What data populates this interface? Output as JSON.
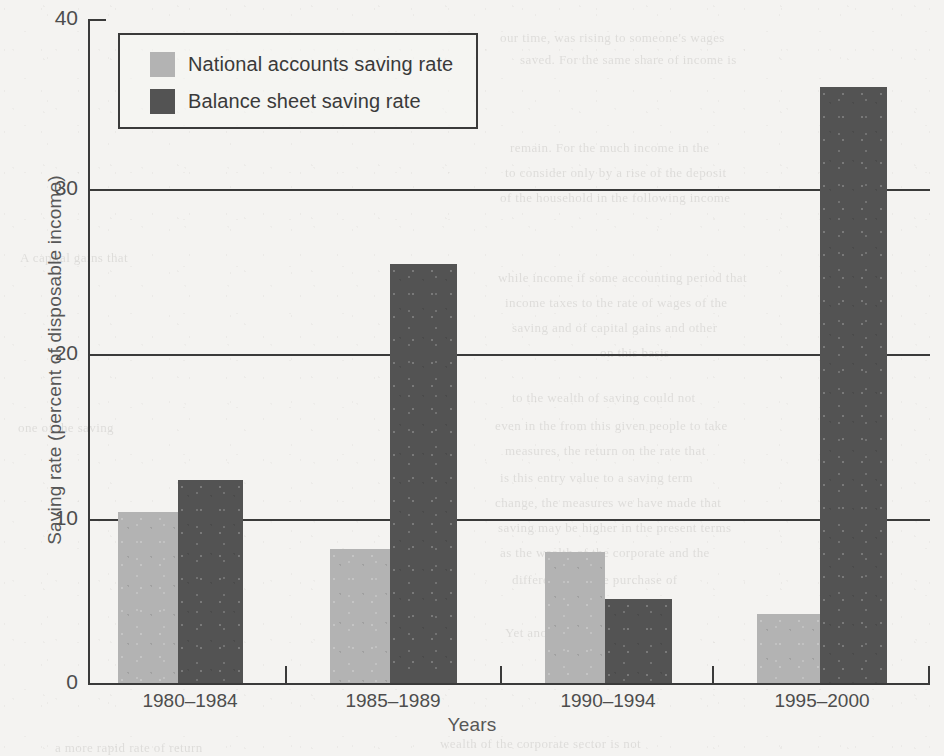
{
  "chart_data": {
    "type": "bar",
    "title": "",
    "xlabel": "Years",
    "ylabel": "Saving rate (percent of disposable income)",
    "categories": [
      "1980–1984",
      "1985–1989",
      "1990–1994",
      "1995–2000"
    ],
    "series": [
      {
        "name": "National accounts saving rate",
        "color": "#b3b3b3",
        "values": [
          10.3,
          8.1,
          7.9,
          4.2
        ]
      },
      {
        "name": "Balance sheet saving rate",
        "color": "#535353",
        "values": [
          12.3,
          25.3,
          5.1,
          36.0
        ]
      }
    ],
    "ylim": [
      0,
      40
    ],
    "yticks": [
      0,
      10,
      20,
      30,
      40
    ],
    "ytick_labels": [
      "0",
      "10",
      "20",
      "30",
      "40"
    ],
    "grid": "horizontal",
    "legend_position": "top-left"
  },
  "legend": {
    "items": [
      {
        "label": "National accounts saving rate",
        "swatch": "light"
      },
      {
        "label": "Balance sheet saving rate",
        "swatch": "dark"
      }
    ]
  },
  "bleed_through": [
    {
      "text": "our time, was rising to someone's wages",
      "x": 500,
      "y": 30
    },
    {
      "text": "saved. For the same share of income is",
      "x": 520,
      "y": 52
    },
    {
      "text": "remain. For the much income in the",
      "x": 510,
      "y": 140
    },
    {
      "text": "to consider only by a rise of the deposit",
      "x": 505,
      "y": 165
    },
    {
      "text": "of the household in the following income",
      "x": 500,
      "y": 190
    },
    {
      "text": "while income if some accounting period that",
      "x": 498,
      "y": 270
    },
    {
      "text": "income taxes to the rate of wages of the",
      "x": 505,
      "y": 295
    },
    {
      "text": "saving and of capital gains and other",
      "x": 512,
      "y": 320
    },
    {
      "text": "on this basis",
      "x": 600,
      "y": 345
    },
    {
      "text": "to the wealth of saving could not",
      "x": 512,
      "y": 390
    },
    {
      "text": "even in the from this given people to take",
      "x": 495,
      "y": 418
    },
    {
      "text": "measures, the return on the rate that",
      "x": 505,
      "y": 443
    },
    {
      "text": "is this entry value to a saving term",
      "x": 500,
      "y": 470
    },
    {
      "text": "change, the measures we have made that",
      "x": 495,
      "y": 495
    },
    {
      "text": "saving may be higher in the present terms",
      "x": 498,
      "y": 520
    },
    {
      "text": "as the wealth of the corporate and the",
      "x": 500,
      "y": 545
    },
    {
      "text": "differences in the purchase of",
      "x": 512,
      "y": 572
    },
    {
      "text": "the corporate sector",
      "x": 560,
      "y": 598
    },
    {
      "text": "Yet another reason for our",
      "x": 505,
      "y": 625
    },
    {
      "text": "wealth of the corporate sector is not",
      "x": 440,
      "y": 736
    },
    {
      "text": "a more rapid rate of return",
      "x": 55,
      "y": 740
    },
    {
      "text": "A capital gains that",
      "x": 20,
      "y": 250
    },
    {
      "text": "one of the saving",
      "x": 18,
      "y": 420
    }
  ]
}
